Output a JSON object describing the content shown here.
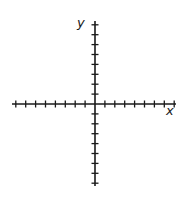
{
  "diagram": {
    "type": "coordinate-plane",
    "axes": {
      "x_label": "x",
      "y_label": "y",
      "ticks_per_half_axis": 8,
      "tick_spacing_px": 9.9,
      "origin_px": [
        95,
        104
      ],
      "x_extent_px": [
        12,
        176
      ],
      "y_extent_px": [
        21,
        186
      ],
      "color": "#1a1a1a"
    }
  }
}
